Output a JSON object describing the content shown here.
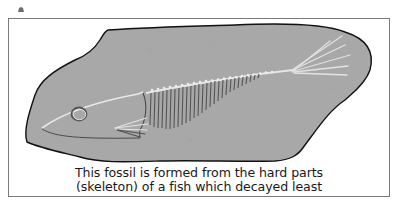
{
  "figure": {
    "caption": {
      "line1": "This fossil is formed from the hard parts",
      "line2": "(skeleton) of a fish which decayed least"
    },
    "colors": {
      "rock_fill": "#a8a8a8",
      "rock_outline": "#111111",
      "bone_light": "#e6e6e6",
      "bone_dark": "#555555",
      "frame_border": "#7a7a7a",
      "caption_text": "#1a1a1a"
    },
    "icons": {
      "corner_mark": "page-marker-icon"
    }
  }
}
